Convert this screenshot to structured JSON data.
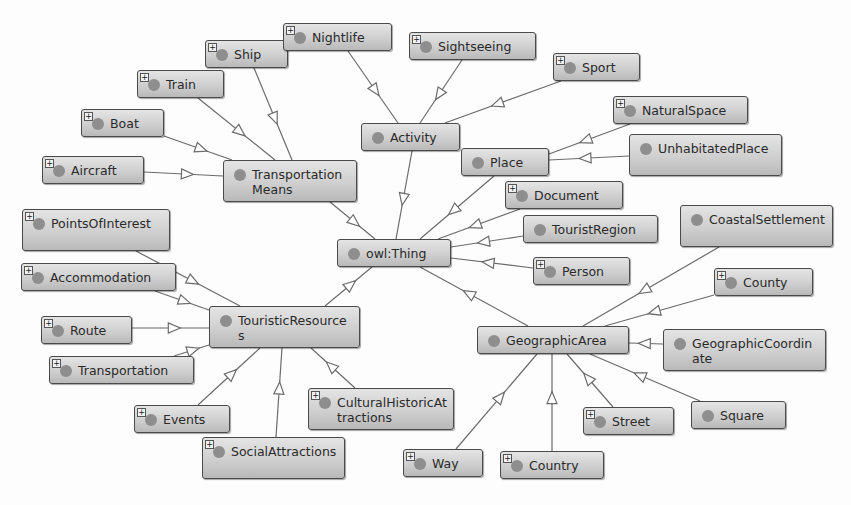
{
  "diagram": {
    "type": "ontology-class-graph",
    "colors": {
      "node_fill_top": "#e4e4e4",
      "node_fill_bottom": "#b9b9b9",
      "node_border": "#4a4a4a",
      "dot": "#8e8e8e",
      "edge": "#6b6b6b"
    },
    "nodes": [
      {
        "id": "thing",
        "label": "owl:Thing",
        "x": 337,
        "y": 239,
        "w": 114,
        "h": 28,
        "expandable": false
      },
      {
        "id": "transport",
        "label": "TransportationMeans",
        "x": 223,
        "y": 160,
        "w": 134,
        "h": 42,
        "expandable": false
      },
      {
        "id": "ship",
        "label": "Ship",
        "x": 205,
        "y": 40,
        "w": 83,
        "h": 28,
        "expandable": true
      },
      {
        "id": "nightlife",
        "label": "Nightlife",
        "x": 283,
        "y": 23,
        "w": 109,
        "h": 28,
        "expandable": true
      },
      {
        "id": "train",
        "label": "Train",
        "x": 137,
        "y": 70,
        "w": 87,
        "h": 28,
        "expandable": true
      },
      {
        "id": "boat",
        "label": "Boat",
        "x": 81,
        "y": 109,
        "w": 83,
        "h": 28,
        "expandable": true
      },
      {
        "id": "aircraft",
        "label": "Aircraft",
        "x": 42,
        "y": 156,
        "w": 102,
        "h": 28,
        "expandable": true
      },
      {
        "id": "activity",
        "label": "Activity",
        "x": 361,
        "y": 123,
        "w": 99,
        "h": 28,
        "expandable": false
      },
      {
        "id": "sightseeing",
        "label": "Sightseeing",
        "x": 409,
        "y": 32,
        "w": 127,
        "h": 28,
        "expandable": true
      },
      {
        "id": "sport",
        "label": "Sport",
        "x": 553,
        "y": 53,
        "w": 87,
        "h": 28,
        "expandable": true
      },
      {
        "id": "place",
        "label": "Place",
        "x": 461,
        "y": 148,
        "w": 88,
        "h": 28,
        "expandable": false
      },
      {
        "id": "natural",
        "label": "NaturalSpace",
        "x": 613,
        "y": 96,
        "w": 135,
        "h": 28,
        "expandable": true
      },
      {
        "id": "unhab",
        "label": "UnhabitatedPlace",
        "x": 629,
        "y": 134,
        "w": 153,
        "h": 42,
        "expandable": false
      },
      {
        "id": "document",
        "label": "Document",
        "x": 505,
        "y": 181,
        "w": 118,
        "h": 28,
        "expandable": true
      },
      {
        "id": "region",
        "label": "TouristRegion",
        "x": 523,
        "y": 215,
        "w": 135,
        "h": 28,
        "expandable": false
      },
      {
        "id": "person",
        "label": "Person",
        "x": 533,
        "y": 257,
        "w": 97,
        "h": 28,
        "expandable": true
      },
      {
        "id": "touristic",
        "label": "TouristicResources",
        "x": 209,
        "y": 306,
        "w": 151,
        "h": 42,
        "expandable": false
      },
      {
        "id": "poi",
        "label": "PointsOfInterest",
        "x": 22,
        "y": 209,
        "w": 148,
        "h": 42,
        "expandable": true
      },
      {
        "id": "accom",
        "label": "Accommodation",
        "x": 21,
        "y": 263,
        "w": 155,
        "h": 28,
        "expandable": true
      },
      {
        "id": "route",
        "label": "Route",
        "x": 41,
        "y": 316,
        "w": 91,
        "h": 28,
        "expandable": true
      },
      {
        "id": "transportation",
        "label": "Transportation",
        "x": 49,
        "y": 356,
        "w": 145,
        "h": 28,
        "expandable": true
      },
      {
        "id": "events",
        "label": "Events",
        "x": 134,
        "y": 405,
        "w": 96,
        "h": 28,
        "expandable": true
      },
      {
        "id": "social",
        "label": "SocialAttractions",
        "x": 202,
        "y": 437,
        "w": 143,
        "h": 42,
        "expandable": true
      },
      {
        "id": "cultural",
        "label": "CulturalHistoricAttractions",
        "x": 308,
        "y": 388,
        "w": 146,
        "h": 42,
        "expandable": true
      },
      {
        "id": "geo",
        "label": "GeographicArea",
        "x": 477,
        "y": 326,
        "w": 152,
        "h": 28,
        "expandable": false
      },
      {
        "id": "coastal",
        "label": "CoastalSettlement",
        "x": 680,
        "y": 205,
        "w": 153,
        "h": 42,
        "expandable": false
      },
      {
        "id": "county",
        "label": "County",
        "x": 714,
        "y": 268,
        "w": 99,
        "h": 28,
        "expandable": true
      },
      {
        "id": "coord",
        "label": "GeographicCoordinate",
        "x": 663,
        "y": 329,
        "w": 163,
        "h": 42,
        "expandable": false
      },
      {
        "id": "square",
        "label": "Square",
        "x": 691,
        "y": 401,
        "w": 95,
        "h": 28,
        "expandable": false
      },
      {
        "id": "street",
        "label": "Street",
        "x": 583,
        "y": 407,
        "w": 91,
        "h": 28,
        "expandable": true
      },
      {
        "id": "country",
        "label": "Country",
        "x": 500,
        "y": 451,
        "w": 104,
        "h": 28,
        "expandable": true
      },
      {
        "id": "way",
        "label": "Way",
        "x": 403,
        "y": 449,
        "w": 80,
        "h": 28,
        "expandable": true
      }
    ],
    "edges": [
      {
        "from": "transport",
        "to": "thing",
        "x1": 330,
        "y1": 202,
        "x2": 375,
        "y2": 239
      },
      {
        "from": "activity",
        "to": "thing",
        "x1": 412,
        "y1": 151,
        "x2": 396,
        "y2": 239
      },
      {
        "from": "place",
        "to": "thing",
        "x1": 494,
        "y1": 176,
        "x2": 420,
        "y2": 239
      },
      {
        "from": "document",
        "to": "thing",
        "x1": 520,
        "y1": 209,
        "x2": 438,
        "y2": 239
      },
      {
        "from": "region",
        "to": "thing",
        "x1": 523,
        "y1": 236,
        "x2": 451,
        "y2": 247
      },
      {
        "from": "person",
        "to": "thing",
        "x1": 533,
        "y1": 268,
        "x2": 451,
        "y2": 258
      },
      {
        "from": "touristic",
        "to": "thing",
        "x1": 325,
        "y1": 306,
        "x2": 372,
        "y2": 267
      },
      {
        "from": "geo",
        "to": "thing",
        "x1": 528,
        "y1": 326,
        "x2": 420,
        "y2": 267
      },
      {
        "from": "ship",
        "to": "transport",
        "x1": 254,
        "y1": 68,
        "x2": 292,
        "y2": 160
      },
      {
        "from": "train",
        "to": "transport",
        "x1": 198,
        "y1": 98,
        "x2": 275,
        "y2": 160
      },
      {
        "from": "boat",
        "to": "transport",
        "x1": 164,
        "y1": 136,
        "x2": 232,
        "y2": 160
      },
      {
        "from": "aircraft",
        "to": "transport",
        "x1": 144,
        "y1": 172,
        "x2": 223,
        "y2": 176
      },
      {
        "from": "nightlife",
        "to": "activity",
        "x1": 348,
        "y1": 51,
        "x2": 398,
        "y2": 123
      },
      {
        "from": "sightseeing",
        "to": "activity",
        "x1": 462,
        "y1": 60,
        "x2": 420,
        "y2": 123
      },
      {
        "from": "sport",
        "to": "activity",
        "x1": 561,
        "y1": 81,
        "x2": 445,
        "y2": 123
      },
      {
        "from": "natural",
        "to": "place",
        "x1": 630,
        "y1": 124,
        "x2": 549,
        "y2": 154
      },
      {
        "from": "unhab",
        "to": "place",
        "x1": 629,
        "y1": 156,
        "x2": 549,
        "y2": 160
      },
      {
        "from": "poi",
        "to": "touristic",
        "x1": 136,
        "y1": 251,
        "x2": 240,
        "y2": 306
      },
      {
        "from": "accom",
        "to": "touristic",
        "x1": 155,
        "y1": 291,
        "x2": 209,
        "y2": 310
      },
      {
        "from": "route",
        "to": "touristic",
        "x1": 132,
        "y1": 328,
        "x2": 209,
        "y2": 328
      },
      {
        "from": "transportation",
        "to": "touristic",
        "x1": 174,
        "y1": 356,
        "x2": 209,
        "y2": 345
      },
      {
        "from": "events",
        "to": "touristic",
        "x1": 198,
        "y1": 405,
        "x2": 260,
        "y2": 348
      },
      {
        "from": "social",
        "to": "touristic",
        "x1": 276,
        "y1": 437,
        "x2": 282,
        "y2": 348
      },
      {
        "from": "cultural",
        "to": "touristic",
        "x1": 355,
        "y1": 388,
        "x2": 311,
        "y2": 348
      },
      {
        "from": "coastal",
        "to": "geo",
        "x1": 719,
        "y1": 247,
        "x2": 583,
        "y2": 326
      },
      {
        "from": "county",
        "to": "geo",
        "x1": 714,
        "y1": 295,
        "x2": 605,
        "y2": 326
      },
      {
        "from": "coord",
        "to": "geo",
        "x1": 663,
        "y1": 344,
        "x2": 629,
        "y2": 343
      },
      {
        "from": "square",
        "to": "geo",
        "x1": 700,
        "y1": 401,
        "x2": 590,
        "y2": 354
      },
      {
        "from": "street",
        "to": "geo",
        "x1": 613,
        "y1": 407,
        "x2": 567,
        "y2": 354
      },
      {
        "from": "country",
        "to": "geo",
        "x1": 552,
        "y1": 451,
        "x2": 552,
        "y2": 354
      },
      {
        "from": "way",
        "to": "geo",
        "x1": 456,
        "y1": 449,
        "x2": 537,
        "y2": 354
      }
    ]
  }
}
